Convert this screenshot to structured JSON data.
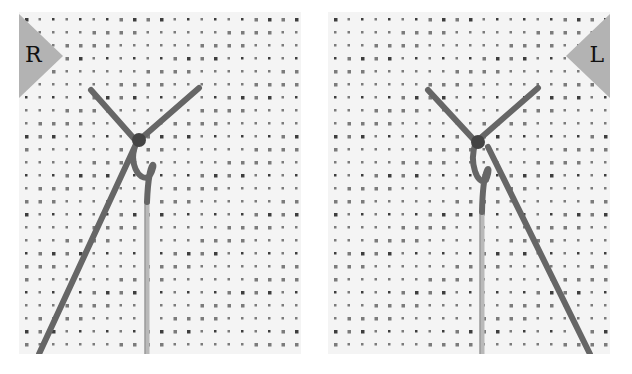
{
  "panels": [
    {
      "id": "right-hand",
      "label": "R",
      "description": "Needle and thread forming knot, right-handed view"
    },
    {
      "id": "left-hand",
      "label": "L",
      "description": "Needle and thread forming knot, left-handed view"
    }
  ],
  "colors": {
    "fabric": "#f4f4f4",
    "hole": "#2a2a2a",
    "thread": "#6a6a6a",
    "badge": "#b3b3b3",
    "needle": "#bdbdbd"
  }
}
